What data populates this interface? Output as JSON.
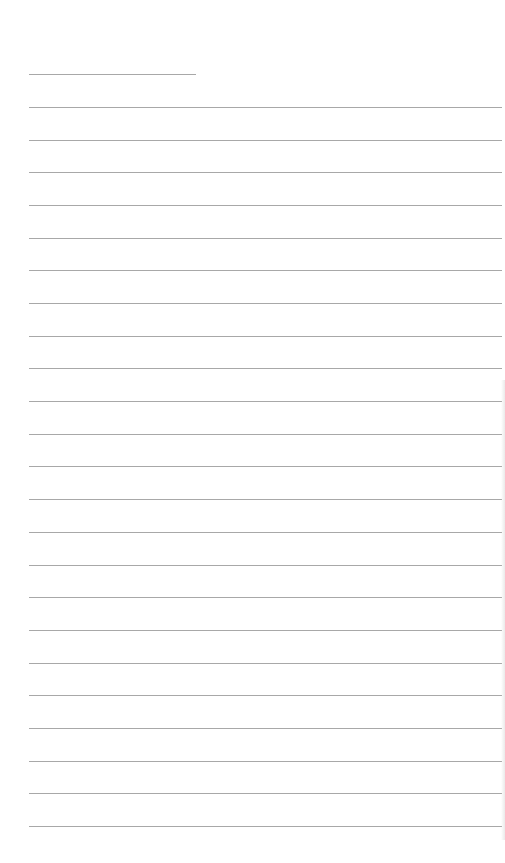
{
  "document": {
    "type": "lined-paper",
    "background_color": "#ffffff",
    "line_color": "#a8a8a8",
    "header_line": {
      "x": 29,
      "y": 74,
      "width": 167
    },
    "ruled_lines": {
      "count": 23,
      "x": 29,
      "width": 473,
      "first_y": 107,
      "spacing": 32.68
    }
  }
}
